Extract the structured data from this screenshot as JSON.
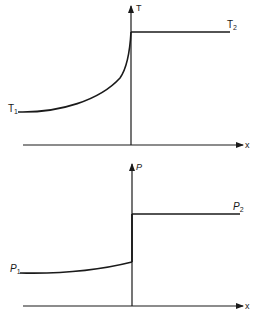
{
  "panels": [
    {
      "id": "temperature",
      "y_axis_label": "T",
      "x_axis_label": "x",
      "left_label": "T",
      "left_label_sub": "1",
      "right_label": "T",
      "right_label_sub": "2"
    },
    {
      "id": "pressure",
      "y_axis_label": "P",
      "x_axis_label": "x",
      "left_label": "P",
      "left_label_sub": "1",
      "right_label": "P",
      "right_label_sub": "2"
    }
  ],
  "colors": {
    "ink": "#1a1a1a",
    "background": "#ffffff"
  }
}
